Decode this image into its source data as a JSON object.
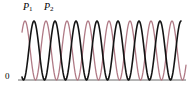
{
  "figure": {
    "width": 188,
    "height": 90,
    "background": "#ffffff"
  },
  "labels": {
    "origin": "0",
    "curve1_base": "P",
    "curve1_sub": "1",
    "curve2_base": "P",
    "curve2_sub": "2"
  },
  "colors": {
    "curve1": "#141414",
    "curve2": "#b07a86",
    "axis": "#6b6b6b",
    "text": "#000000"
  },
  "chart_data": {
    "type": "line",
    "title": "",
    "xlabel": "",
    "ylabel": "",
    "grid": false,
    "legend_position": "top-left-inline",
    "xlim": [
      0,
      188
    ],
    "ylim": [
      0,
      1
    ],
    "axis_baseline_y": 80,
    "peak_y": 21,
    "series": [
      {
        "name": "P1",
        "color": "#141414",
        "waveform": "sin-squared",
        "period_px": 42,
        "phase_px": 34,
        "peaks_x": [
          34,
          76,
          118,
          160
        ],
        "peak_value": 1.0,
        "trough_value": 0.0,
        "x_start": 22,
        "x_end": 181,
        "line_width": 1.6
      },
      {
        "name": "P2",
        "color": "#b07a86",
        "waveform": "sin-squared",
        "period_px": 42,
        "phase_px": 46,
        "peaks_x": [
          46,
          88,
          130,
          172
        ],
        "peak_value": 1.0,
        "trough_value": 0.0,
        "x_start": 22,
        "x_end": 186,
        "line_width": 1.3
      }
    ],
    "axis_line": {
      "x_start": 18,
      "x_end": 186,
      "y": 80
    }
  }
}
